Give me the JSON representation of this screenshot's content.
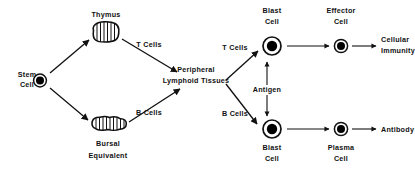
{
  "diagram": {
    "background_color": "#ffffff",
    "stroke_color": "#111111",
    "nodes": {
      "stem_cell": {
        "label_line1": "Stem",
        "label_line2": "Cell",
        "x": 38,
        "y": 80,
        "type": "cell"
      },
      "thymus": {
        "label": "Thymus",
        "x": 105,
        "y": 35,
        "type": "organ-trapezoid"
      },
      "bursal": {
        "label_line1": "Bursal",
        "label_line2": "Equivalent",
        "x": 108,
        "y": 125,
        "type": "organ-oval"
      },
      "peripheral": {
        "label_line1": "Peripheral",
        "label_line2": "Lymphoid  Tissues",
        "x": 196,
        "y": 78,
        "type": "text"
      },
      "blast_top": {
        "label_line1": "Blast",
        "label_line2": "Cell",
        "x": 272,
        "y": 46,
        "type": "cell"
      },
      "blast_bottom": {
        "label_line1": "Blast",
        "label_line2": "Cell",
        "x": 272,
        "y": 129,
        "type": "cell"
      },
      "effector": {
        "label_line1": "Effector",
        "label_line2": "Cell",
        "x": 341,
        "y": 46,
        "type": "cell-small"
      },
      "plasma": {
        "label_line1": "Plasma",
        "label_line2": "Cell",
        "x": 341,
        "y": 129,
        "type": "cell-small"
      },
      "cellular_immunity": {
        "label_line1": "Cellular",
        "label_line2": "Immunity",
        "x": 398,
        "y": 46,
        "type": "text"
      },
      "antibody": {
        "label": "Antibody",
        "x": 398,
        "y": 129,
        "type": "text"
      }
    },
    "edge_labels": {
      "t_cells_left": "T Cells",
      "b_cells_left": "B Cells",
      "t_cells_right": "T Cells",
      "b_cells_right": "B Cells",
      "antigen": "Antigen"
    }
  }
}
